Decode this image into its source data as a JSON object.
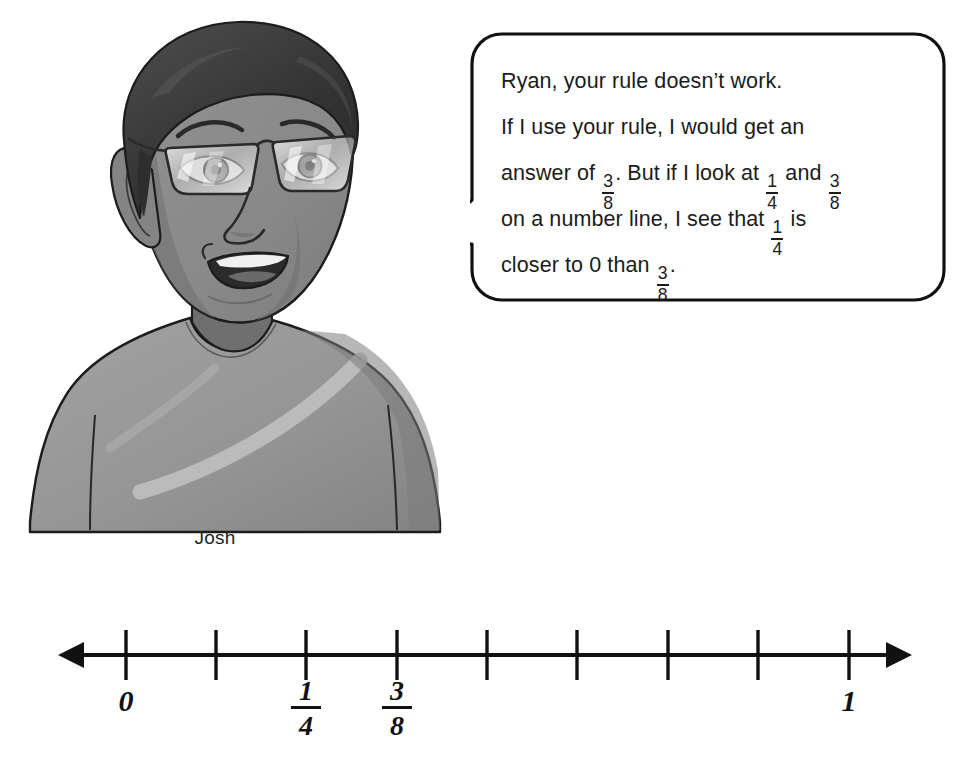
{
  "character": {
    "name": "Josh",
    "name_label": "Josh",
    "description": "cartoon boy with glasses wearing a gray t-shirt",
    "colors": {
      "hair": "#3a3a3a",
      "skin": "#8c8c8c",
      "skin_shadow": "#6f6f6f",
      "shirt": "#9a9a9a",
      "shirt_shadow": "#868686",
      "outline": "#1c1c1c",
      "lens": "#d8d8d8",
      "teeth": "#f2f2f2"
    }
  },
  "speech_bubble": {
    "speaker": "Josh",
    "addressed_to": "Ryan",
    "border_color": "#111111",
    "fill_color": "#ffffff",
    "lines": [
      {
        "id": "line1",
        "parts": [
          {
            "type": "text",
            "value": "Ryan, your rule doesn’t work."
          }
        ]
      },
      {
        "id": "line2",
        "parts": [
          {
            "type": "text",
            "value": "If I use your rule, I would get an"
          }
        ]
      },
      {
        "id": "line3",
        "parts": [
          {
            "type": "text",
            "value": "answer of "
          },
          {
            "type": "fraction",
            "numerator": "3",
            "denominator": "8"
          },
          {
            "type": "text",
            "value": ". But if I look at "
          },
          {
            "type": "fraction",
            "numerator": "1",
            "denominator": "4"
          },
          {
            "type": "text",
            "value": " and "
          },
          {
            "type": "fraction",
            "numerator": "3",
            "denominator": "8"
          }
        ]
      },
      {
        "id": "line4",
        "parts": [
          {
            "type": "text",
            "value": "on a number line, I see that "
          },
          {
            "type": "fraction",
            "numerator": "1",
            "denominator": "4"
          },
          {
            "type": "text",
            "value": " is"
          }
        ]
      },
      {
        "id": "line5",
        "parts": [
          {
            "type": "text",
            "value": "closer to 0 than "
          },
          {
            "type": "fraction",
            "numerator": "3",
            "denominator": "8"
          },
          {
            "type": "text",
            "value": "."
          }
        ]
      }
    ],
    "plain_text": "Ryan, your rule doesn’t work. If I use your rule, I would get an answer of 3/8. But if I look at 1/4 and 3/8 on a number line, I see that 1/4 is closer to 0 than 3/8."
  },
  "chart_data": {
    "type": "number-line",
    "title": "",
    "xlabel": "",
    "ylabel": "",
    "axis_color": "#111111",
    "line_y": 55,
    "arrow_left_x": 58,
    "arrow_right_x": 912,
    "tick_count": 9,
    "tick_interval_px": 90.4,
    "ticks": [
      {
        "x": 126,
        "value": 0,
        "label": "0",
        "label_type": "whole"
      },
      {
        "x": 216,
        "value": 0.125,
        "label": "",
        "label_type": "none"
      },
      {
        "x": 306,
        "value": 0.25,
        "label": "1/4",
        "label_type": "fraction",
        "numerator": "1",
        "denominator": "4"
      },
      {
        "x": 397,
        "value": 0.375,
        "label": "3/8",
        "label_type": "fraction",
        "numerator": "3",
        "denominator": "8"
      },
      {
        "x": 487,
        "value": 0.5,
        "label": "",
        "label_type": "none"
      },
      {
        "x": 577,
        "value": 0.625,
        "label": "",
        "label_type": "none"
      },
      {
        "x": 668,
        "value": 0.75,
        "label": "",
        "label_type": "none"
      },
      {
        "x": 758,
        "value": 0.875,
        "label": "",
        "label_type": "none"
      },
      {
        "x": 849,
        "value": 1,
        "label": "1",
        "label_type": "whole"
      }
    ],
    "labeled_points": [
      {
        "label": "0",
        "value": 0,
        "x": 126
      },
      {
        "label": "1/4",
        "value": 0.25,
        "x": 306
      },
      {
        "label": "3/8",
        "value": 0.375,
        "x": 397
      },
      {
        "label": "1",
        "value": 1,
        "x": 849
      }
    ],
    "xlim": [
      -0.09,
      1.08
    ],
    "grid": false,
    "legend": "none"
  }
}
